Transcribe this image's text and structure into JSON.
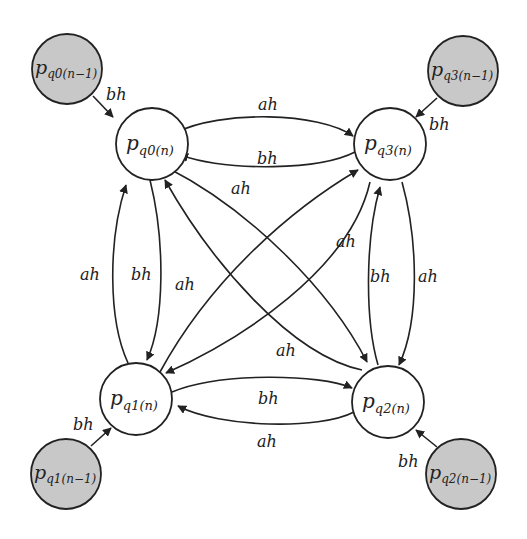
{
  "diagram": {
    "type": "state-transition",
    "colors": {
      "current_node_fill": "#ffffff",
      "previous_node_fill": "#c8c8c8",
      "stroke": "#222222"
    },
    "nodes": [
      {
        "id": "q0n",
        "base": "p",
        "sub": "q0(n)",
        "kind": "current"
      },
      {
        "id": "q3n",
        "base": "p",
        "sub": "q3(n)",
        "kind": "current"
      },
      {
        "id": "q1n",
        "base": "p",
        "sub": "q1(n)",
        "kind": "current"
      },
      {
        "id": "q2n",
        "base": "p",
        "sub": "q2(n)",
        "kind": "current"
      },
      {
        "id": "q0p",
        "base": "p",
        "sub": "q0(n−1)",
        "kind": "previous"
      },
      {
        "id": "q3p",
        "base": "p",
        "sub": "q3(n−1)",
        "kind": "previous"
      },
      {
        "id": "q1p",
        "base": "p",
        "sub": "q1(n−1)",
        "kind": "previous"
      },
      {
        "id": "q2p",
        "base": "p",
        "sub": "q2(n−1)",
        "kind": "previous"
      }
    ],
    "edges": [
      {
        "from": "q0p",
        "to": "q0n",
        "label": "bh"
      },
      {
        "from": "q3p",
        "to": "q3n",
        "label": "bh"
      },
      {
        "from": "q1p",
        "to": "q1n",
        "label": "bh"
      },
      {
        "from": "q2p",
        "to": "q2n",
        "label": "bh"
      },
      {
        "from": "q0n",
        "to": "q3n",
        "label": "ah"
      },
      {
        "from": "q3n",
        "to": "q0n",
        "label": "bh"
      },
      {
        "from": "q1n",
        "to": "q2n",
        "label": "bh"
      },
      {
        "from": "q2n",
        "to": "q1n",
        "label": "ah"
      },
      {
        "from": "q1n",
        "to": "q0n",
        "label": "ah"
      },
      {
        "from": "q0n",
        "to": "q1n",
        "label": "bh"
      },
      {
        "from": "q2n",
        "to": "q3n",
        "label": "bh"
      },
      {
        "from": "q3n",
        "to": "q2n",
        "label": "ah"
      },
      {
        "from": "q0n",
        "to": "q2n",
        "label": "ah"
      },
      {
        "from": "q2n",
        "to": "q0n",
        "label": "ah"
      },
      {
        "from": "q1n",
        "to": "q3n",
        "label": "ah"
      },
      {
        "from": "q3n",
        "to": "q1n",
        "label": "ah"
      }
    ]
  }
}
